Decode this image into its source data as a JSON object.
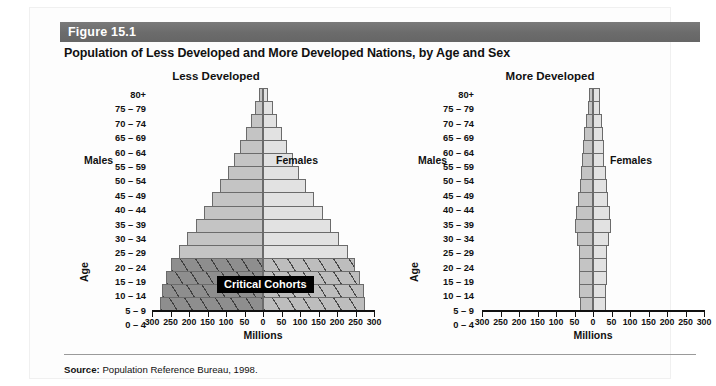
{
  "figure": {
    "number": "Figure 15.1",
    "title": "Population of Less Developed and More Developed Nations, by Age and Sex"
  },
  "source": {
    "label": "Source:",
    "text": " Population Reference Bureau, 1998."
  },
  "callout": {
    "critical_cohorts": "Critical Cohorts"
  },
  "labels": {
    "males": "Males",
    "females": "Females",
    "age_axis": "Age",
    "millions_axis": "Millions"
  },
  "colors": {
    "band": "#6e6e6e",
    "male_bar": "#c4c4c4",
    "female_bar": "#e2e2e2",
    "male_bar_critical": "#8e8e8e",
    "female_bar_critical": "#bdbdbd",
    "bar_border": "#6b6b6b",
    "callout_background": "#000000",
    "callout_text": "#ffffff",
    "text": "#111111"
  },
  "chart_data": [
    {
      "type": "bar",
      "title": "Less Developed",
      "subtype": "population-pyramid",
      "xlabel": "Millions",
      "ylabel": "Age",
      "xlim": [
        -300,
        300
      ],
      "xticks": [
        -300,
        -250,
        -200,
        -150,
        -100,
        -50,
        0,
        50,
        100,
        150,
        200,
        250,
        300
      ],
      "xticklabels": [
        "300",
        "250",
        "200",
        "150",
        "100",
        "50",
        "0",
        "50",
        "100",
        "150",
        "200",
        "250",
        "300"
      ],
      "grid": false,
      "legend": [
        "Males",
        "Females"
      ],
      "categories": [
        "80+",
        "75 – 79",
        "70 – 74",
        "65 – 69",
        "60 – 64",
        "55 – 59",
        "50 – 54",
        "45 – 49",
        "40 – 44",
        "35 – 39",
        "30 – 34",
        "25 – 29",
        "20 – 24",
        "15 – 19",
        "10 – 14",
        "5 – 9",
        "0 – 4"
      ],
      "series": [
        {
          "name": "Males",
          "side": "left",
          "values": [
            10,
            22,
            33,
            47,
            62,
            78,
            95,
            115,
            138,
            160,
            182,
            205,
            228,
            248,
            262,
            272,
            278
          ]
        },
        {
          "name": "Females",
          "side": "right",
          "values": [
            13,
            26,
            37,
            50,
            65,
            80,
            97,
            117,
            139,
            161,
            183,
            206,
            229,
            249,
            263,
            272,
            277
          ]
        }
      ],
      "highlight": {
        "label": "Critical Cohorts",
        "categories": [
          "15 – 19",
          "10 – 14",
          "5 – 9",
          "0 – 4"
        ]
      }
    },
    {
      "type": "bar",
      "title": "More Developed",
      "subtype": "population-pyramid",
      "xlabel": "Millions",
      "ylabel": "Age",
      "xlim": [
        -300,
        300
      ],
      "xticks": [
        -300,
        -250,
        -200,
        -150,
        -100,
        -50,
        0,
        50,
        100,
        150,
        200,
        250,
        300
      ],
      "xticklabels": [
        "300",
        "250",
        "200",
        "150",
        "100",
        "50",
        "0",
        "50",
        "100",
        "150",
        "200",
        "250",
        "300"
      ],
      "grid": false,
      "legend": [
        "Males",
        "Females"
      ],
      "categories": [
        "80+",
        "75 – 79",
        "70 – 74",
        "65 – 69",
        "60 – 64",
        "55 – 59",
        "50 – 54",
        "45 – 49",
        "40 – 44",
        "35 – 39",
        "30 – 34",
        "25 – 29",
        "20 – 24",
        "15 – 19",
        "10 – 14",
        "5 – 9",
        "0 – 4"
      ],
      "series": [
        {
          "name": "Males",
          "side": "left",
          "values": [
            11,
            14,
            20,
            24,
            27,
            30,
            33,
            36,
            40,
            47,
            48,
            42,
            39,
            38,
            39,
            38,
            35
          ]
        },
        {
          "name": "Females",
          "side": "right",
          "values": [
            19,
            20,
            24,
            27,
            29,
            31,
            34,
            37,
            41,
            47,
            48,
            42,
            39,
            37,
            37,
            36,
            34
          ]
        }
      ],
      "highlight": null
    }
  ]
}
